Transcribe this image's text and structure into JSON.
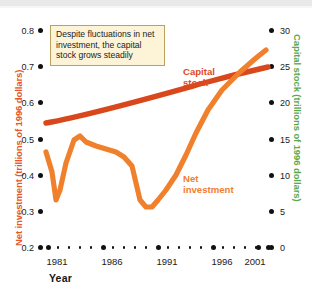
{
  "axes": {
    "y_left_title": "Net investment (trillions of 1996 dollars)",
    "y_left_color": "#e8552a",
    "y_right_title": "Capital stock (trillions of 1996 dollars)",
    "y_right_color": "#5aa84f",
    "x_title": "Year",
    "y_left_ticks": [
      "0.8",
      "0.7",
      "0.6",
      "0.5",
      "0.4",
      "0.3",
      "0.2"
    ],
    "y_right_ticks": [
      "30",
      "25",
      "20",
      "15",
      "10",
      "5",
      "0"
    ],
    "x_ticks": [
      "1981",
      "1986",
      "1991",
      "1996",
      "2001"
    ]
  },
  "callout": {
    "text": "Despite fluctuations in net investment, the capital stock grows steadily",
    "fill": "#fdf4d8",
    "border": "#b9a25e"
  },
  "series_labels": {
    "capital": "Capital\nstock",
    "capital_line1": "Capital",
    "capital_line2": "stock",
    "net_line1": "Net",
    "net_line2": "investment"
  },
  "chart_data": {
    "type": "line",
    "title": "",
    "xlabel": "Year",
    "ylabel": "Net investment (trillions of 1996 dollars)",
    "ylabel_right": "Capital stock (trillions of 1996 dollars)",
    "xlim": [
      1980,
      2001.5
    ],
    "ylim": [
      0.2,
      0.8
    ],
    "ylim_right": [
      0,
      30
    ],
    "grid": false,
    "legend": "inline-annotations",
    "annotations": [
      {
        "text": "Despite fluctuations in net investment, the capital stock grows steadily",
        "x": 1981,
        "y": 0.78
      }
    ],
    "series": [
      {
        "name": "Net investment",
        "axis": "left",
        "color": "#f0802c",
        "units": "trillions of 1996 dollars",
        "x": [
          1980,
          1981,
          1982,
          1983,
          1984,
          1985,
          1986,
          1987,
          1988,
          1989,
          1990,
          1991,
          1992,
          1993,
          1994,
          1995,
          1996,
          1997,
          1998,
          1999,
          2000,
          2001
        ],
        "values": [
          0.375,
          0.335,
          0.29,
          0.34,
          0.44,
          0.49,
          0.475,
          0.465,
          0.455,
          0.45,
          0.43,
          0.325,
          0.32,
          0.345,
          0.39,
          0.44,
          0.5,
          0.565,
          0.625,
          0.665,
          0.705,
          0.735
        ]
      },
      {
        "name": "Capital stock",
        "axis": "right",
        "color": "#d9471c",
        "units": "trillions of 1996 dollars",
        "x": [
          1980,
          1983,
          1986,
          1989,
          1992,
          1995,
          1998,
          2001
        ],
        "values": [
          15.0,
          16.4,
          17.8,
          19.1,
          20.4,
          21.7,
          23.2,
          24.9
        ]
      }
    ]
  }
}
